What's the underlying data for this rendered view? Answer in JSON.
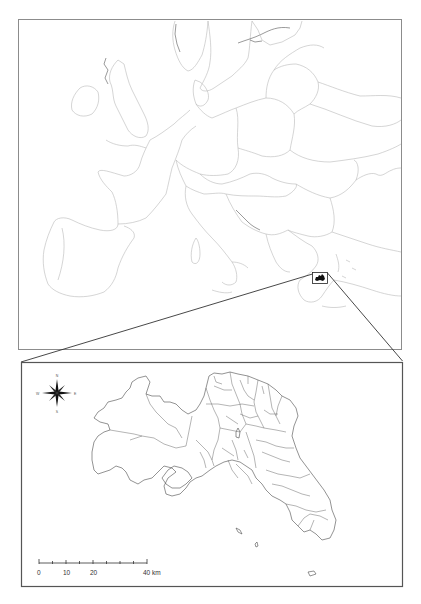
{
  "figure": {
    "overview_map": {
      "region": "Europe",
      "highlight": "Attica (Greece) location inset box"
    },
    "detail_map": {
      "region": "Attica municipalities",
      "compass": {
        "n": "N",
        "s": "S",
        "e": "E",
        "w": "W"
      },
      "scale_bar": {
        "ticks": [
          "0",
          "10",
          "20",
          "40 km"
        ],
        "unit": "km"
      }
    },
    "colors": {
      "background": "#ffffff",
      "border": "#8c8c8c",
      "country_lines": "#b9b9b9",
      "municipality_lines": "#4a4a4a",
      "highlight": "#111111"
    }
  }
}
